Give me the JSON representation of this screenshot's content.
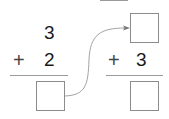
{
  "problem_left": {
    "top_number": "3",
    "operator": "+",
    "second_number": "2",
    "answer": ""
  },
  "problem_right": {
    "top_number": "",
    "operator": "+",
    "second_number": "3",
    "answer": ""
  },
  "colors": {
    "text": "#1a1a1a",
    "box_border": "#8c8c8c",
    "rule": "#9a9a9a",
    "arrow": "#999999"
  }
}
